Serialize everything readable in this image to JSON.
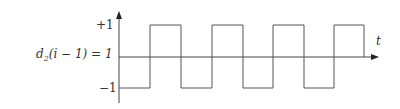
{
  "diagram": {
    "type": "square-wave",
    "condition_label": "d",
    "condition_subscript": "2",
    "condition_rest": "(i − 1) = 1",
    "y_labels": {
      "high": "+1",
      "low": "−1"
    },
    "x_label": "t",
    "levels": {
      "high": 1,
      "low": -1
    },
    "start_level": -1,
    "half_periods": 8,
    "colors": {
      "line": "#555555",
      "axis": "#444444"
    }
  }
}
